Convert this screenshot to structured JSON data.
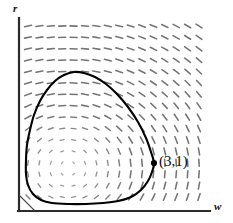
{
  "figure": {
    "kind": "phase-portrait",
    "background_color": "#ffffff",
    "width": 233,
    "height": 223
  },
  "axes": {
    "x_label": "w",
    "y_label": "r",
    "axis_color": "#2b2b2b",
    "origin_px": [
      19,
      211
    ],
    "x_axis_end_px": [
      210,
      211
    ],
    "y_axis_top_px": [
      19,
      18
    ]
  },
  "annotations": [
    {
      "name": "orbit-point",
      "text": "(3,1)",
      "marker": "filled-dot",
      "marker_color": "#000000",
      "marker_px": [
        154,
        163
      ],
      "text_px": [
        159,
        154
      ]
    }
  ],
  "chart_data": {
    "type": "scatter",
    "title": "",
    "subtitle": "",
    "xlabel": "w",
    "ylabel": "r",
    "grid": false,
    "legend": null,
    "field": {
      "description": "direction field of dashes circulating counterclockwise about a center",
      "dash_color": "#6e6e6e",
      "dash_length": 7,
      "dash_thickness": 1.3,
      "cols": 16,
      "rows": 16,
      "x_start_px": 28,
      "y_start_px": 26,
      "x_step_px": 11.4,
      "y_step_px": 11.4,
      "center_px": [
        68,
        168
      ],
      "rotation": "counterclockwise",
      "radial_falloff": 78
    },
    "orbit": {
      "name": "closed periodic orbit",
      "color": "#000000",
      "line_width": 2.1,
      "closed": true,
      "points_px": [
        [
          154,
          163
        ],
        [
          152,
          172
        ],
        [
          148,
          181
        ],
        [
          141,
          190
        ],
        [
          131,
          197
        ],
        [
          118,
          201
        ],
        [
          103,
          203
        ],
        [
          86,
          204
        ],
        [
          68,
          204
        ],
        [
          52,
          203
        ],
        [
          41,
          200
        ],
        [
          33,
          194
        ],
        [
          28,
          185
        ],
        [
          26,
          174
        ],
        [
          26,
          160
        ],
        [
          27,
          145
        ],
        [
          30,
          130
        ],
        [
          34,
          115
        ],
        [
          40,
          101
        ],
        [
          47,
          90
        ],
        [
          55,
          81
        ],
        [
          64,
          75
        ],
        [
          74,
          72
        ],
        [
          84,
          73
        ],
        [
          95,
          77
        ],
        [
          106,
          84
        ],
        [
          117,
          94
        ],
        [
          128,
          107
        ],
        [
          138,
          122
        ],
        [
          146,
          138
        ],
        [
          151,
          152
        ],
        [
          154,
          163
        ]
      ]
    },
    "annotated_points": [
      {
        "label": "(3,1)",
        "x": 3,
        "y": 1,
        "px": [
          154,
          163
        ]
      }
    ]
  }
}
